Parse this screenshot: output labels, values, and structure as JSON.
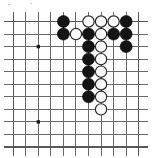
{
  "figure": {
    "name": "go-board-diagram",
    "type": "go-position",
    "board": {
      "columns": 11,
      "rows": 11,
      "origin_x": 13.2,
      "origin_y": 21.5,
      "spacing": 12.55,
      "line_color": "#666a6c",
      "background_color": "#ffffff"
    },
    "star_points": [
      {
        "col": 2,
        "row": 2
      },
      {
        "col": 2,
        "row": 8
      }
    ],
    "stone_radius": 6.0,
    "colors": {
      "black": "#141414",
      "white": "#fdfdfd",
      "white_outline": "#252525"
    },
    "stones": [
      {
        "color": "black",
        "col": 4,
        "row": 0
      },
      {
        "color": "white",
        "col": 6,
        "row": 0
      },
      {
        "color": "white",
        "col": 7,
        "row": 0
      },
      {
        "color": "white",
        "col": 8,
        "row": 0
      },
      {
        "color": "black",
        "col": 9,
        "row": 0
      },
      {
        "color": "black",
        "col": 4,
        "row": 1
      },
      {
        "color": "white",
        "col": 5,
        "row": 1
      },
      {
        "color": "black",
        "col": 6,
        "row": 1
      },
      {
        "color": "white",
        "col": 7,
        "row": 1
      },
      {
        "color": "black",
        "col": 8,
        "row": 1
      },
      {
        "color": "black",
        "col": 9,
        "row": 1
      },
      {
        "color": "black",
        "col": 6,
        "row": 2
      },
      {
        "color": "white",
        "col": 7,
        "row": 2
      },
      {
        "color": "black",
        "col": 9,
        "row": 2
      },
      {
        "color": "black",
        "col": 6,
        "row": 3
      },
      {
        "color": "white",
        "col": 7,
        "row": 3
      },
      {
        "color": "black",
        "col": 6,
        "row": 4
      },
      {
        "color": "white",
        "col": 7,
        "row": 4
      },
      {
        "color": "black",
        "col": 6,
        "row": 5
      },
      {
        "color": "white",
        "col": 7,
        "row": 5
      },
      {
        "color": "black",
        "col": 6,
        "row": 6
      },
      {
        "color": "white",
        "col": 7,
        "row": 6
      },
      {
        "color": "white",
        "col": 7,
        "row": 7
      }
    ]
  }
}
